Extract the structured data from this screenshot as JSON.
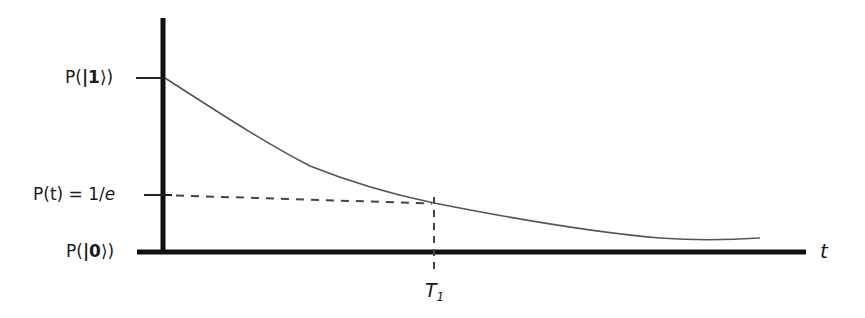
{
  "diagram": {
    "title": "",
    "colors": {
      "axis": "#111111",
      "curve": "#555555",
      "dashed": "#444444",
      "text": "#1a1a1a",
      "background": "#ffffff"
    },
    "y_axis": {
      "ticks": [
        {
          "id": "p1",
          "prefix": "P(",
          "bar": "|",
          "state": "1",
          "suffix": "⟩)",
          "y": 78
        },
        {
          "id": "pe",
          "text": "P(t) = 1/",
          "italic": "e",
          "y": 195
        },
        {
          "id": "p0",
          "prefix": "P(",
          "bar": "|",
          "state": "0",
          "suffix": "⟩)",
          "y": 252
        }
      ]
    },
    "x_axis": {
      "label": "t",
      "marker": {
        "label": "T",
        "subscript": "1",
        "x": 434
      }
    },
    "curve": {
      "description": "exponential decay from P(|1⟩) toward P(|0⟩)",
      "points": [
        [
          165,
          78
        ],
        [
          200,
          100
        ],
        [
          240,
          125
        ],
        [
          280,
          148
        ],
        [
          300,
          160
        ],
        [
          340,
          176
        ],
        [
          380,
          188
        ],
        [
          434,
          203
        ],
        [
          500,
          214
        ],
        [
          560,
          225
        ],
        [
          620,
          233
        ],
        [
          660,
          237
        ],
        [
          700,
          240
        ],
        [
          760,
          238
        ]
      ]
    },
    "annotations": {
      "horizontal_dashed": {
        "from": [
          166,
          195
        ],
        "to": [
          434,
          204
        ]
      },
      "vertical_dashed": {
        "from": [
          434,
          204
        ],
        "to": [
          434,
          272
        ]
      }
    }
  }
}
